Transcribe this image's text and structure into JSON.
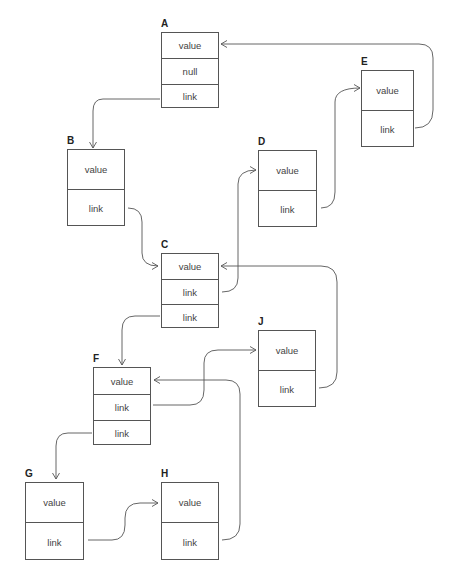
{
  "diagram": {
    "type": "linked-structure",
    "nodes": [
      {
        "id": "A",
        "label": "A",
        "x": 161,
        "y": 32,
        "w": 58,
        "h": 76,
        "cell_h": 25.33,
        "cells": [
          "value",
          "null",
          "link"
        ]
      },
      {
        "id": "B",
        "label": "B",
        "x": 67,
        "y": 149,
        "w": 58,
        "h": 77,
        "cell_h": 38.5,
        "cells": [
          "value",
          "link"
        ]
      },
      {
        "id": "C",
        "label": "C",
        "x": 161,
        "y": 253,
        "w": 58,
        "h": 75,
        "cell_h": 25,
        "cells": [
          "value",
          "link",
          "link"
        ]
      },
      {
        "id": "D",
        "label": "D",
        "x": 258,
        "y": 150,
        "w": 59,
        "h": 77,
        "cell_h": 38.5,
        "cells": [
          "value",
          "link"
        ]
      },
      {
        "id": "E",
        "label": "E",
        "x": 361,
        "y": 70,
        "w": 53,
        "h": 77,
        "cell_h": 38.5,
        "cells": [
          "value",
          "link"
        ]
      },
      {
        "id": "F",
        "label": "F",
        "x": 93,
        "y": 367,
        "w": 58,
        "h": 78,
        "cell_h": 26,
        "cells": [
          "value",
          "link",
          "link"
        ]
      },
      {
        "id": "J",
        "label": "J",
        "x": 258,
        "y": 330,
        "w": 58,
        "h": 77,
        "cell_h": 38.5,
        "cells": [
          "value",
          "link"
        ]
      },
      {
        "id": "G",
        "label": "G",
        "x": 25,
        "y": 482,
        "w": 59,
        "h": 78,
        "cell_h": 39,
        "cells": [
          "value",
          "link"
        ]
      },
      {
        "id": "H",
        "label": "H",
        "x": 161,
        "y": 482,
        "w": 58,
        "h": 78,
        "cell_h": 39,
        "cells": [
          "value",
          "link"
        ]
      }
    ],
    "edges": [
      {
        "from": "A.link",
        "to": "B",
        "d": "M 160 99 L 103 99 Q 93 99 93 111 L 93 148"
      },
      {
        "from": "E.link",
        "to": "A.value",
        "d": "M 415 128 Q 433 128 433 110 L 433 58 Q 433 44 419 44 L 221 44"
      },
      {
        "from": "B.link",
        "to": "C.value",
        "d": "M 128 208 Q 142 208 142 222 L 142 253 Q 142 266 158 266"
      },
      {
        "from": "C.link",
        "to": "D.value",
        "d": "M 222 292 Q 238 292 238 278 L 238 184 Q 238 170 256 170"
      },
      {
        "from": "D.link",
        "to": "E.value",
        "d": "M 321 208 Q 335 208 335 192 L 335 102 Q 335 88 360 88"
      },
      {
        "from": "J.link",
        "to": "C.value",
        "d": "M 319 388 Q 337 388 337 372 L 337 282 Q 337 266 321 266 L 221 266"
      },
      {
        "from": "C.link2",
        "to": "F",
        "d": "M 160 316 L 135 316 Q 122 316 122 330 L 122 365"
      },
      {
        "from": "F.link",
        "to": "J.value",
        "d": "M 153 405 L 190 405 Q 204 405 204 390 L 204 363 Q 204 350 218 350 L 256 350"
      },
      {
        "from": "H.link",
        "to": "F.value",
        "d": "M 222 540 Q 240 540 240 524 L 240 394 Q 240 380 226 380 L 154 380"
      },
      {
        "from": "F.link2",
        "to": "G",
        "d": "M 92 433 L 68 433 Q 56 433 56 446 L 56 479"
      },
      {
        "from": "G.link",
        "to": "H.value",
        "d": "M 88 540 L 112 540 Q 125 540 125 525 L 125 518 Q 125 503 140 503 L 158 503"
      }
    ],
    "colors": {
      "line": "#555555",
      "text": "#444444",
      "label": "#222222",
      "background": "#ffffff"
    }
  }
}
